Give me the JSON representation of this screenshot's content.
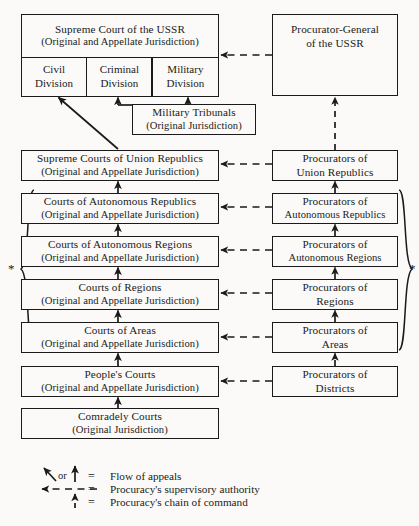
{
  "diagram": {
    "courts": [
      {
        "id": "supreme-court-ussr",
        "line1": "Supreme Court of the USSR",
        "line2": "(Original and Appellate Jurisdiction)"
      },
      {
        "id": "supreme-courts-union-republics",
        "line1": "Supreme Courts of Union Republics",
        "line2": "(Original and Appellate Jurisdiction)"
      },
      {
        "id": "courts-autonomous-republics",
        "line1": "Courts of Autonomous Republics",
        "line2": "(Original and Appellate Jurisdiction)"
      },
      {
        "id": "courts-autonomous-regions",
        "line1": "Courts of Autonomous Regions",
        "line2": "(Original and Appellate Jurisdiction)"
      },
      {
        "id": "courts-regions",
        "line1": "Courts of Regions",
        "line2": "(Original and Appellate Jurisdiction)"
      },
      {
        "id": "courts-areas",
        "line1": "Courts of Areas",
        "line2": "(Original and Appellate Jurisdiction)"
      },
      {
        "id": "peoples-courts",
        "line1": "People's Courts",
        "line2": "(Original and Appellate Jurisdiction)"
      },
      {
        "id": "comradely-courts",
        "line1": "Comradely Courts",
        "line2": "(Original Jurisdiction)"
      }
    ],
    "divisions": [
      {
        "id": "civil-division",
        "line1": "Civil",
        "line2": "Division"
      },
      {
        "id": "criminal-division",
        "line1": "Criminal",
        "line2": "Division"
      },
      {
        "id": "military-division",
        "line1": "Military",
        "line2": "Division"
      }
    ],
    "military_tribunals": {
      "line1": "Military Tribunals",
      "line2": "(Original Jurisdiction)"
    },
    "procuracy": [
      {
        "id": "procurator-general-ussr",
        "line1": "Procurator-General",
        "line2": "of the USSR"
      },
      {
        "id": "procurators-union-republics",
        "line1": "Procurators of",
        "line2": "Union Republics"
      },
      {
        "id": "procurators-autonomous-republics",
        "line1": "Procurators of",
        "line2": "Autonomous Republics"
      },
      {
        "id": "procurators-autonomous-regions",
        "line1": "Procurators of",
        "line2": "Autonomous Regions"
      },
      {
        "id": "procurators-regions",
        "line1": "Procurators of",
        "line2": "Regions"
      },
      {
        "id": "procurators-areas",
        "line1": "Procurators of",
        "line2": "Areas"
      },
      {
        "id": "procurators-districts",
        "line1": "Procurators of",
        "line2": "Districts"
      }
    ],
    "annotations": {
      "star_left": "*",
      "star_right": "*"
    },
    "legend": {
      "or_label": "or",
      "equals": "=",
      "items": [
        {
          "id": "flow-of-appeals",
          "label": "Flow of appeals"
        },
        {
          "id": "supervisory-authority",
          "label": "Procuracy's supervisory authority"
        },
        {
          "id": "chain-of-command",
          "label": "Procuracy's chain of command"
        }
      ]
    }
  },
  "colors": {
    "ink": "#1a1a1a",
    "paper": "#fbfaf8"
  }
}
